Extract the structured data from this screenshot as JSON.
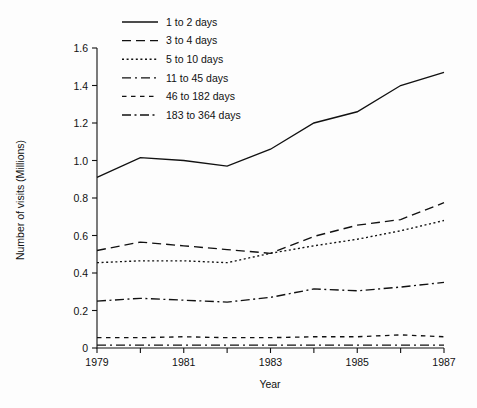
{
  "chart_data": {
    "type": "line",
    "title": "",
    "xlabel": "Year",
    "ylabel": "Number of visits  (Millions)",
    "x": [
      1979,
      1980,
      1981,
      1982,
      1983,
      1984,
      1985,
      1986,
      1987
    ],
    "xlim": [
      1979,
      1987
    ],
    "ylim": [
      0,
      1.6
    ],
    "xticks": [
      1979,
      1980,
      1981,
      1982,
      1983,
      1984,
      1985,
      1986,
      1987
    ],
    "xtick_labels": [
      "1979",
      "",
      "1981",
      "",
      "1983",
      "",
      "1985",
      "",
      "1987"
    ],
    "yticks": [
      0,
      0.2,
      0.4,
      0.6,
      0.8,
      1.0,
      1.2,
      1.4,
      1.6
    ],
    "ytick_labels": [
      "0",
      "0.2",
      "0.4",
      "0.6",
      "0.8",
      "1.0",
      "1.2",
      "1.4",
      "1.6"
    ],
    "grid": false,
    "legend_position": "top-left",
    "series": [
      {
        "name": "1 to 2 days",
        "dash": "none",
        "values": [
          0.91,
          1.015,
          1.0,
          0.97,
          1.06,
          1.2,
          1.26,
          1.4,
          1.47
        ]
      },
      {
        "name": "3 to 4 days",
        "dash": "long-dash",
        "values": [
          0.52,
          0.565,
          0.545,
          0.525,
          0.505,
          0.595,
          0.655,
          0.685,
          0.775
        ]
      },
      {
        "name": "5 to 10 days",
        "dash": "dotted",
        "values": [
          0.455,
          0.465,
          0.465,
          0.455,
          0.505,
          0.545,
          0.58,
          0.625,
          0.68
        ]
      },
      {
        "name": "11 to 45 days",
        "dash": "long-dash-dot",
        "values": [
          0.015,
          0.015,
          0.015,
          0.015,
          0.015,
          0.015,
          0.015,
          0.015,
          0.015
        ]
      },
      {
        "name": "46 to 182 days",
        "dash": "short-dash",
        "values": [
          0.055,
          0.055,
          0.06,
          0.055,
          0.055,
          0.06,
          0.06,
          0.07,
          0.06
        ]
      },
      {
        "name": "183 to 364 days",
        "dash": "dash-dot-dot",
        "values": [
          0.25,
          0.265,
          0.255,
          0.245,
          0.27,
          0.315,
          0.305,
          0.325,
          0.35
        ]
      }
    ]
  },
  "colors": {
    "background": "#fdfdfd",
    "ink": "#111111"
  }
}
